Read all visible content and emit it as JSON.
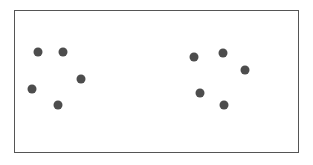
{
  "figure": {
    "title": "",
    "background_color": "#ffffff",
    "frame": {
      "x": 14,
      "y": 10,
      "width": 284,
      "height": 142,
      "border_color": "#555555",
      "border_width": 1,
      "fill_color": "#ffffff"
    }
  },
  "chart_data": {
    "type": "scatter",
    "title": "",
    "xlabel": "",
    "ylabel": "",
    "xlim": [
      14,
      298
    ],
    "ylim": [
      10,
      152
    ],
    "grid": false,
    "legend": null,
    "axis_ticks": false,
    "point_style": {
      "marker": "circle",
      "color": "#4d4d4d",
      "radius": 4.5
    },
    "point_count": 10,
    "cluster_count": 2,
    "series": [
      {
        "name": "left-cluster",
        "color": "#4d4d4d",
        "points": [
          {
            "x": 38,
            "y": 52
          },
          {
            "x": 63,
            "y": 52
          },
          {
            "x": 81,
            "y": 79
          },
          {
            "x": 32,
            "y": 89
          },
          {
            "x": 58,
            "y": 105
          }
        ]
      },
      {
        "name": "right-cluster",
        "color": "#4d4d4d",
        "points": [
          {
            "x": 194,
            "y": 57
          },
          {
            "x": 223,
            "y": 53
          },
          {
            "x": 245,
            "y": 70
          },
          {
            "x": 200,
            "y": 93
          },
          {
            "x": 224,
            "y": 105
          }
        ]
      }
    ]
  }
}
